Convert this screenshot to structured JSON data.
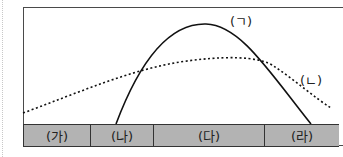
{
  "diagram": {
    "curves": [
      {
        "id": "curve-a",
        "label": "(ㄱ)",
        "style": "solid"
      },
      {
        "id": "curve-b",
        "label": "(ㄴ)",
        "style": "dotted"
      }
    ],
    "segments": [
      {
        "label": "(가)",
        "width": 67
      },
      {
        "label": "(나)",
        "width": 63
      },
      {
        "label": "(다)",
        "width": 111
      },
      {
        "label": "(라)",
        "width": 75
      }
    ]
  }
}
